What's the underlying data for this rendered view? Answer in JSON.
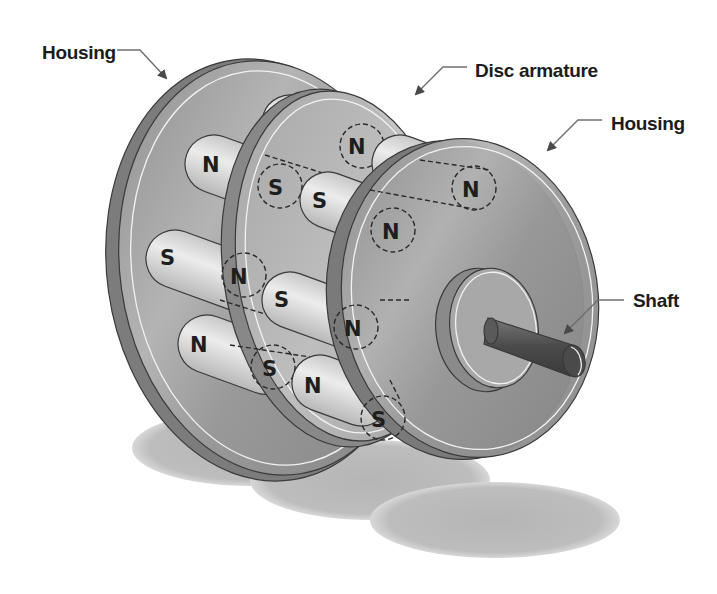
{
  "diagram": {
    "labels": {
      "housing_left": "Housing",
      "disc_armature": "Disc armature",
      "housing_right": "Housing",
      "shaft": "Shaft"
    },
    "magnets": [
      {
        "id": "m1",
        "visible_pole": "S",
        "hidden_pole": "N"
      },
      {
        "id": "m2",
        "visible_pole": "N",
        "hidden_pole": "S"
      },
      {
        "id": "m3",
        "visible_pole": "S",
        "hidden_pole": "N"
      },
      {
        "id": "m4",
        "visible_pole": "N",
        "hidden_pole": "S"
      },
      {
        "id": "m5",
        "visible_pole": "S",
        "hidden_pole": "N"
      },
      {
        "id": "m6",
        "visible_pole": "S",
        "hidden_pole": "N"
      },
      {
        "id": "m7",
        "visible_pole": "N",
        "hidden_pole": "S"
      },
      {
        "id": "m8",
        "visible_pole": "N",
        "hidden_pole": "S"
      }
    ],
    "colors": {
      "housing": "#9a9a9a",
      "magnet": "#d8d8d8",
      "shaft": "#555555",
      "shadow": "#b8b8b8",
      "text": "#1c1c1c"
    }
  }
}
